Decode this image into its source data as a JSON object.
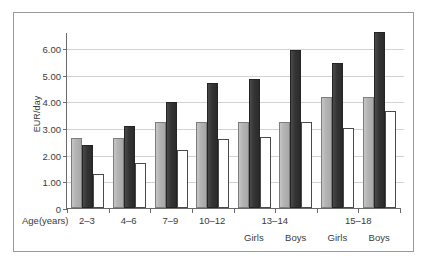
{
  "chart_data": {
    "type": "bar",
    "title": "",
    "subtitle": "",
    "xlabel": "Age(years)",
    "ylabel": "EUR/day",
    "ylim": [
      0,
      6.6
    ],
    "y_ticks": [
      "0",
      "1.00",
      "2.00",
      "3.00",
      "4.00",
      "5.00",
      "6.00"
    ],
    "y_tick_values": [
      0,
      1,
      2,
      3,
      4,
      5,
      6
    ],
    "grid": "horizontal",
    "legend": "none",
    "categories": [
      "2–3",
      "4–6",
      "7–9",
      "10–12",
      "13–14 Girls",
      "13–14 Boys",
      "15–18 Girls",
      "15–18 Boys"
    ],
    "category_row1": [
      "2–3",
      "4–6",
      "7–9",
      "10–12",
      "13–14",
      "15–18"
    ],
    "category_row2": [
      "",
      "",
      "",
      "",
      "Girls",
      "Boys",
      "Girls",
      "Boys"
    ],
    "series": [
      {
        "name": "series-gray",
        "color": "#b4b4b4",
        "values": [
          2.63,
          2.64,
          3.22,
          3.23,
          3.24,
          3.24,
          4.15,
          4.15
        ]
      },
      {
        "name": "series-dark",
        "color": "#343434",
        "values": [
          2.35,
          3.08,
          3.97,
          4.7,
          4.83,
          5.92,
          5.42,
          6.6
        ]
      },
      {
        "name": "series-white",
        "color": "#ffffff",
        "values": [
          1.28,
          1.7,
          2.17,
          2.58,
          2.66,
          3.24,
          3.0,
          3.65
        ]
      }
    ]
  },
  "frame": {
    "border_color": "#9a9a9a",
    "background": "#ffffff"
  }
}
